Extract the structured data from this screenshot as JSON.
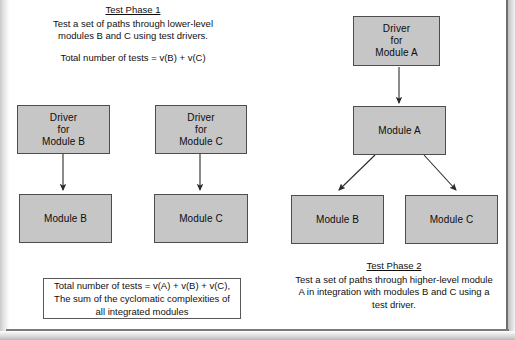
{
  "diagram": {
    "phase1": {
      "title": "Test Phase 1",
      "line1": "Test a set of paths through lower-level",
      "line2": "modules B and C using test drivers.",
      "formula": "Total number of tests = v(B) + v(C)"
    },
    "phase2": {
      "title": "Test Phase 2",
      "line1": "Test a set of paths through higher-level module",
      "line2": "A in integration with modules B and C using a",
      "line3": "test driver."
    },
    "summary_box": {
      "line1": "Total number of tests = v(A) + v(B) + v(C),",
      "line2": "The sum of the cyclomatic complexities of all",
      "line3": "integrated modules"
    },
    "boxes": {
      "driver_b": {
        "l1": "Driver",
        "l2": "for",
        "l3": "Module B"
      },
      "driver_c": {
        "l1": "Driver",
        "l2": "for",
        "l3": "Module C"
      },
      "driver_a": {
        "l1": "Driver",
        "l2": "for",
        "l3": "Module A"
      },
      "module_b_left": {
        "l1": "Module B"
      },
      "module_c_left": {
        "l1": "Module C"
      },
      "module_a": {
        "l1": "Module A"
      },
      "module_b_right": {
        "l1": "Module B"
      },
      "module_c_right": {
        "l1": "Module C"
      }
    },
    "colors": {
      "box_fill": "#c6c6c6",
      "box_border": "#4d4d4d",
      "text": "#101010",
      "arrow": "#2b2b2b",
      "page_background": "#ffffff"
    }
  }
}
